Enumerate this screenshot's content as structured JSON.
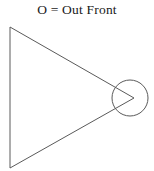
{
  "canvas": {
    "width": 154,
    "height": 171,
    "background_color": "#ffffff"
  },
  "caption": {
    "text": "O = Out Front",
    "symbol": "O",
    "separator": "=",
    "definition": "Out Front",
    "color": "#1a1a1a"
  },
  "diagram": {
    "name": "out-front-triangle-diagram",
    "stroke_color": "#5a5a5a",
    "stroke_width": 1,
    "fill": "none",
    "triangle": {
      "label": "triangle",
      "points": "10,27 10,168 134,98",
      "vertices": [
        {
          "name": "top-left",
          "x": 10,
          "y": 27
        },
        {
          "name": "bottom-left",
          "x": 10,
          "y": 168
        },
        {
          "name": "apex-right",
          "x": 134,
          "y": 98
        }
      ]
    },
    "circle": {
      "label": "out-front-circle",
      "cx": 130,
      "cy": 98,
      "r": 18
    }
  }
}
